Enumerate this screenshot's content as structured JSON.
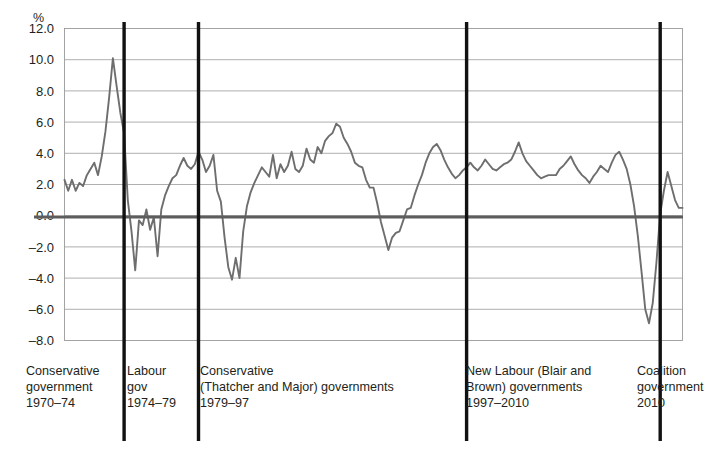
{
  "chart_data": {
    "type": "line",
    "title": "",
    "xlabel": "",
    "ylabel": "%",
    "ylim": [
      -8.0,
      12.0
    ],
    "xlim": [
      1970.0,
      2011.5
    ],
    "grid": true,
    "legend_position": "none",
    "y_ticks": [
      "12.0",
      "10.0",
      "8.0",
      "6.0",
      "4.0",
      "2.0",
      "0.0",
      "-2.0",
      "-4.0",
      "-6.0",
      "-8.0"
    ],
    "y_tick_values": [
      12.0,
      10.0,
      8.0,
      6.0,
      4.0,
      2.0,
      0.0,
      -2.0,
      -4.0,
      -6.0,
      -8.0
    ],
    "series": [
      {
        "name": "UK GDP annual growth rate",
        "color": "#6e6e6e",
        "x": [
          1970.0,
          1970.25,
          1970.5,
          1970.75,
          1971.0,
          1971.25,
          1971.5,
          1971.75,
          1972.0,
          1972.25,
          1972.5,
          1972.75,
          1973.0,
          1973.25,
          1973.5,
          1973.75,
          1974.0,
          1974.25,
          1974.5,
          1974.75,
          1975.0,
          1975.25,
          1975.5,
          1975.75,
          1976.0,
          1976.25,
          1976.5,
          1976.75,
          1977.0,
          1977.25,
          1977.5,
          1977.75,
          1978.0,
          1978.25,
          1978.5,
          1978.75,
          1979.0,
          1979.25,
          1979.5,
          1979.75,
          1980.0,
          1980.25,
          1980.5,
          1980.75,
          1981.0,
          1981.25,
          1981.5,
          1981.75,
          1982.0,
          1982.25,
          1982.5,
          1982.75,
          1983.0,
          1983.25,
          1983.5,
          1983.75,
          1984.0,
          1984.25,
          1984.5,
          1984.75,
          1985.0,
          1985.25,
          1985.5,
          1985.75,
          1986.0,
          1986.25,
          1986.5,
          1986.75,
          1987.0,
          1987.25,
          1987.5,
          1987.75,
          1988.0,
          1988.25,
          1988.5,
          1988.75,
          1989.0,
          1989.25,
          1989.5,
          1989.75,
          1990.0,
          1990.25,
          1990.5,
          1990.75,
          1991.0,
          1991.25,
          1991.5,
          1991.75,
          1992.0,
          1992.25,
          1992.5,
          1992.75,
          1993.0,
          1993.25,
          1993.5,
          1993.75,
          1994.0,
          1994.25,
          1994.5,
          1994.75,
          1995.0,
          1995.25,
          1995.5,
          1995.75,
          1996.0,
          1996.25,
          1996.5,
          1996.75,
          1997.0,
          1997.25,
          1997.5,
          1997.75,
          1998.0,
          1998.25,
          1998.5,
          1998.75,
          1999.0,
          1999.25,
          1999.5,
          1999.75,
          2000.0,
          2000.25,
          2000.5,
          2000.75,
          2001.0,
          2001.25,
          2001.5,
          2001.75,
          2002.0,
          2002.25,
          2002.5,
          2002.75,
          2003.0,
          2003.25,
          2003.5,
          2003.75,
          2004.0,
          2004.25,
          2004.5,
          2004.75,
          2005.0,
          2005.25,
          2005.5,
          2005.75,
          2006.0,
          2006.25,
          2006.5,
          2006.75,
          2007.0,
          2007.25,
          2007.5,
          2007.75,
          2008.0,
          2008.25,
          2008.5,
          2008.75,
          2009.0,
          2009.25,
          2009.5,
          2009.75,
          2010.0,
          2010.25,
          2010.5,
          2010.75,
          2011.0,
          2011.25,
          2011.5
        ],
        "values": [
          2.3,
          1.6,
          2.3,
          1.6,
          2.1,
          1.9,
          2.6,
          3.0,
          3.4,
          2.6,
          3.8,
          5.4,
          7.6,
          10.1,
          8.3,
          6.6,
          5.3,
          1.0,
          -1.0,
          -3.5,
          -0.3,
          -0.6,
          0.4,
          -0.9,
          -0.1,
          -2.6,
          0.4,
          1.3,
          1.9,
          2.4,
          2.6,
          3.2,
          3.7,
          3.2,
          3.0,
          3.3,
          4.1,
          3.6,
          2.8,
          3.2,
          3.9,
          1.6,
          0.9,
          -1.4,
          -3.3,
          -4.1,
          -2.7,
          -4.0,
          -1.0,
          0.6,
          1.5,
          2.1,
          2.6,
          3.1,
          2.8,
          2.5,
          3.9,
          2.4,
          3.3,
          2.8,
          3.2,
          4.1,
          3.0,
          2.8,
          3.2,
          4.3,
          3.6,
          3.4,
          4.4,
          4.0,
          4.8,
          5.1,
          5.3,
          5.9,
          5.7,
          5.0,
          4.6,
          4.1,
          3.4,
          3.2,
          3.1,
          2.3,
          1.8,
          1.8,
          0.8,
          -0.4,
          -1.3,
          -2.2,
          -1.4,
          -1.1,
          -1.0,
          -0.3,
          0.4,
          0.5,
          1.3,
          2.0,
          2.6,
          3.4,
          4.0,
          4.4,
          4.6,
          4.2,
          3.6,
          3.1,
          2.7,
          2.4,
          2.6,
          2.9,
          3.1,
          3.4,
          3.1,
          2.9,
          3.2,
          3.6,
          3.3,
          3.0,
          2.9,
          3.1,
          3.3,
          3.4,
          3.6,
          4.1,
          4.7,
          4.0,
          3.5,
          3.2,
          2.9,
          2.6,
          2.4,
          2.5,
          2.6,
          2.6,
          2.6,
          3.0,
          3.2,
          3.5,
          3.8,
          3.3,
          2.9,
          2.6,
          2.4,
          2.1,
          2.5,
          2.8,
          3.2,
          3.0,
          2.8,
          3.4,
          3.9,
          4.1,
          3.6,
          3.0,
          2.0,
          0.6,
          -1.3,
          -3.6,
          -6.0,
          -6.9,
          -5.6,
          -3.0,
          0.1,
          1.6,
          2.8,
          1.9,
          1.0,
          0.5,
          0.5
        ]
      }
    ],
    "period_markers": [
      1974.0,
      1979.0,
      1997.0,
      2010.0
    ],
    "annotations": [
      {
        "id": "conservative-1970",
        "lines": [
          "Conservative",
          "government",
          "1970–74"
        ]
      },
      {
        "id": "labour-1974",
        "lines": [
          "Labour",
          "gov",
          "1974–79"
        ]
      },
      {
        "id": "conservative-1979",
        "lines": [
          "Conservative",
          "(Thatcher and Major) governments",
          "1979–97"
        ]
      },
      {
        "id": "new-labour-1997",
        "lines": [
          "New Labour (Blair and",
          "Brown) governments",
          "1997–2010"
        ]
      },
      {
        "id": "coalition-2010",
        "lines": [
          "Coalition",
          "government",
          "2010"
        ]
      }
    ]
  },
  "axis": {
    "unit_label": "%"
  },
  "periods": [
    {
      "label": "Conservative\ngovernment\n1970–74"
    },
    {
      "label": "Labour\ngov\n1974–79"
    },
    {
      "label": "Conservative\n(Thatcher and Major) governments\n1979–97"
    },
    {
      "label": "New Labour (Blair and\nBrown) governments\n1997–2010"
    },
    {
      "label": "Coalition\ngovernment\n2010"
    }
  ],
  "colors": {
    "series": "#6e6e6e",
    "grid": "#9a9a9a",
    "zero_line": "#5d5d5d",
    "divider": "#111111",
    "text": "#231f20"
  }
}
